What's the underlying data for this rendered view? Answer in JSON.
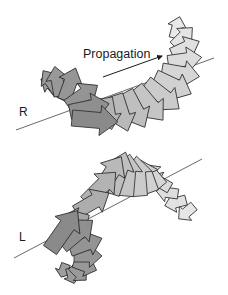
{
  "figure": {
    "propagation_label": "Propagation",
    "right_helix_label": "R",
    "left_helix_label": "L",
    "propagation_arrow": {
      "x1": 103,
      "y1": 77,
      "x2": 162,
      "y2": 56
    },
    "colors": {
      "outline": "#2b2b2b",
      "dark_fill": "#8a8a8a",
      "light_fill": "#ececec",
      "axis": "#444444"
    }
  },
  "helices": [
    {
      "name": "right-circular",
      "axis": {
        "x1": 16,
        "y1": 130,
        "x2": 214,
        "y2": 58
      },
      "arrows": [
        {
          "x": 72,
          "y": 118,
          "ang": 5,
          "len": 46,
          "w": 16,
          "shade": 0.0
        },
        {
          "x": 70,
          "y": 112,
          "ang": -12,
          "len": 40,
          "w": 15,
          "shade": 0.05
        },
        {
          "x": 68,
          "y": 106,
          "ang": -35,
          "len": 36,
          "w": 14,
          "shade": 0.1
        },
        {
          "x": 64,
          "y": 100,
          "ang": -70,
          "len": 34,
          "w": 13,
          "shade": 0.12
        },
        {
          "x": 60,
          "y": 96,
          "ang": -100,
          "len": 30,
          "w": 12,
          "shade": 0.14
        },
        {
          "x": 58,
          "y": 92,
          "ang": -125,
          "len": 26,
          "w": 11,
          "shade": 0.16
        },
        {
          "x": 60,
          "y": 90,
          "ang": -150,
          "len": 22,
          "w": 10,
          "shade": 0.18
        },
        {
          "x": 66,
          "y": 88,
          "ang": -175,
          "len": 20,
          "w": 10,
          "shade": 0.2
        },
        {
          "x": 72,
          "y": 90,
          "ang": 160,
          "len": 18,
          "w": 9,
          "shade": 0.22
        },
        {
          "x": 80,
          "y": 98,
          "ang": 120,
          "len": 16,
          "w": 9,
          "shade": 0.25
        },
        {
          "x": 90,
          "y": 104,
          "ang": 100,
          "len": 18,
          "w": 9,
          "shade": 0.3
        },
        {
          "x": 98,
          "y": 102,
          "ang": 90,
          "len": 24,
          "w": 11,
          "shade": 0.36
        },
        {
          "x": 106,
          "y": 98,
          "ang": 80,
          "len": 32,
          "w": 13,
          "shade": 0.42
        },
        {
          "x": 116,
          "y": 95,
          "ang": 72,
          "len": 38,
          "w": 14,
          "shade": 0.48
        },
        {
          "x": 126,
          "y": 92,
          "ang": 62,
          "len": 40,
          "w": 15,
          "shade": 0.54
        },
        {
          "x": 136,
          "y": 88,
          "ang": 50,
          "len": 42,
          "w": 15,
          "shade": 0.6
        },
        {
          "x": 146,
          "y": 83,
          "ang": 38,
          "len": 42,
          "w": 15,
          "shade": 0.66
        },
        {
          "x": 155,
          "y": 77,
          "ang": 25,
          "len": 40,
          "w": 15,
          "shade": 0.72
        },
        {
          "x": 162,
          "y": 70,
          "ang": 10,
          "len": 38,
          "w": 14,
          "shade": 0.78
        },
        {
          "x": 168,
          "y": 62,
          "ang": -8,
          "len": 34,
          "w": 13,
          "shade": 0.84
        },
        {
          "x": 172,
          "y": 54,
          "ang": -25,
          "len": 30,
          "w": 12,
          "shade": 0.88
        },
        {
          "x": 174,
          "y": 46,
          "ang": -45,
          "len": 26,
          "w": 11,
          "shade": 0.92
        },
        {
          "x": 174,
          "y": 38,
          "ang": -75,
          "len": 22,
          "w": 10,
          "shade": 0.96
        }
      ]
    },
    {
      "name": "left-circular",
      "axis": {
        "x1": 14,
        "y1": 258,
        "x2": 202,
        "y2": 159
      },
      "arrows": [
        {
          "x": 50,
          "y": 250,
          "ang": -55,
          "len": 48,
          "w": 16,
          "shade": 0.0
        },
        {
          "x": 62,
          "y": 246,
          "ang": -40,
          "len": 40,
          "w": 15,
          "shade": 0.06
        },
        {
          "x": 70,
          "y": 250,
          "ang": -20,
          "len": 34,
          "w": 13,
          "shade": 0.1
        },
        {
          "x": 74,
          "y": 256,
          "ang": 0,
          "len": 28,
          "w": 12,
          "shade": 0.12
        },
        {
          "x": 74,
          "y": 262,
          "ang": 20,
          "len": 24,
          "w": 11,
          "shade": 0.14
        },
        {
          "x": 72,
          "y": 266,
          "ang": 45,
          "len": 20,
          "w": 10,
          "shade": 0.16
        },
        {
          "x": 70,
          "y": 268,
          "ang": 75,
          "len": 16,
          "w": 9,
          "shade": 0.18
        },
        {
          "x": 66,
          "y": 264,
          "ang": 110,
          "len": 14,
          "w": 9,
          "shade": 0.2
        },
        {
          "x": 80,
          "y": 226,
          "ang": 160,
          "len": 20,
          "w": 9,
          "shade": 0.26
        },
        {
          "x": 88,
          "y": 220,
          "ang": -165,
          "len": 22,
          "w": 10,
          "shade": 0.3
        },
        {
          "x": 76,
          "y": 212,
          "ang": -30,
          "len": 38,
          "w": 14,
          "shade": 0.36
        },
        {
          "x": 86,
          "y": 202,
          "ang": -45,
          "len": 42,
          "w": 15,
          "shade": 0.42
        },
        {
          "x": 98,
          "y": 194,
          "ang": -58,
          "len": 44,
          "w": 15,
          "shade": 0.48
        },
        {
          "x": 112,
          "y": 194,
          "ang": -72,
          "len": 44,
          "w": 15,
          "shade": 0.54
        },
        {
          "x": 126,
          "y": 196,
          "ang": -85,
          "len": 42,
          "w": 15,
          "shade": 0.6
        },
        {
          "x": 140,
          "y": 196,
          "ang": -95,
          "len": 40,
          "w": 15,
          "shade": 0.66
        },
        {
          "x": 152,
          "y": 192,
          "ang": -110,
          "len": 34,
          "w": 14,
          "shade": 0.72
        },
        {
          "x": 162,
          "y": 186,
          "ang": -130,
          "len": 28,
          "w": 12,
          "shade": 0.78
        },
        {
          "x": 170,
          "y": 188,
          "ang": -150,
          "len": 24,
          "w": 11,
          "shade": 0.82
        },
        {
          "x": 178,
          "y": 194,
          "ang": -172,
          "len": 22,
          "w": 10,
          "shade": 0.86
        },
        {
          "x": 186,
          "y": 200,
          "ang": 165,
          "len": 22,
          "w": 10,
          "shade": 0.9
        },
        {
          "x": 194,
          "y": 206,
          "ang": 140,
          "len": 20,
          "w": 10,
          "shade": 0.94
        }
      ]
    }
  ]
}
